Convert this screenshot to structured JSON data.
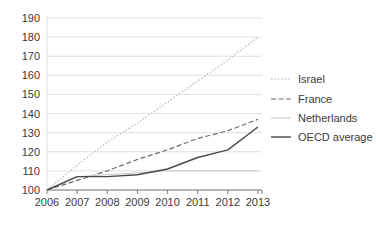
{
  "chart_data": {
    "type": "line",
    "title": "",
    "subtitle": "",
    "xlabel": "",
    "ylabel": "",
    "x": [
      "2006",
      "2007",
      "2008",
      "2009",
      "2010",
      "2011",
      "2012",
      "2013"
    ],
    "categories": [
      "2006",
      "2007",
      "2008",
      "2009",
      "2010",
      "2011",
      "2012",
      "2013"
    ],
    "xlim": [
      2006,
      2013
    ],
    "ylim": [
      100,
      190
    ],
    "ytick_labels": [
      "100",
      "110",
      "120",
      "130",
      "140",
      "150",
      "160",
      "170",
      "180",
      "190"
    ],
    "ytick_values": [
      100,
      110,
      120,
      130,
      140,
      150,
      160,
      170,
      180,
      190
    ],
    "xtick_labels": [
      "2006",
      "2007",
      "2008",
      "2009",
      "2010",
      "2011",
      "2012",
      "2013"
    ],
    "grid": true,
    "grid_axis": "y",
    "legend_position": "right",
    "series": [
      {
        "name": "Israel",
        "style": "dotted",
        "color": "#b5b5b5",
        "width": 1.1,
        "dash": "1.6,1.8",
        "values": [
          100,
          113,
          125,
          135,
          146,
          157,
          168,
          180
        ]
      },
      {
        "name": "France",
        "style": "dashed",
        "color": "#6b6b6b",
        "width": 1.2,
        "dash": "5,2.6",
        "values": [
          100,
          105,
          110,
          116,
          121,
          127,
          131,
          137
        ]
      },
      {
        "name": "Netherlands",
        "style": "solid-light",
        "color": "#c8c8c8",
        "width": 1.0,
        "dash": "none",
        "values": [
          100,
          107,
          108,
          109,
          110,
          110,
          110,
          110
        ]
      },
      {
        "name": "OECD average",
        "style": "solid",
        "color": "#4a4a4a",
        "width": 1.4,
        "dash": "none",
        "values": [
          100,
          107,
          107,
          108,
          111,
          117,
          121,
          133
        ]
      }
    ]
  },
  "legend": {
    "items": [
      {
        "label": "Israel"
      },
      {
        "label": "France"
      },
      {
        "label": "Netherlands"
      },
      {
        "label": "OECD average"
      }
    ]
  },
  "colors": {
    "grid": "#d4d4d4",
    "axis": "#6e6e6e",
    "text": "#3a3a3a",
    "background": "#ffffff"
  }
}
